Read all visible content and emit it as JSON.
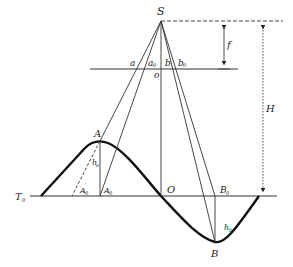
{
  "diagram": {
    "colors": {
      "line": "#333333",
      "curve": "#111111",
      "background": "#ffffff"
    },
    "labels": {
      "S": "S",
      "f": "f",
      "H": "H",
      "a": "a",
      "a0": "a",
      "a0_sub": "0",
      "b": "b",
      "b0": "b",
      "b0_sub": "0",
      "o": "o",
      "A": "A",
      "ha": "h",
      "ha_sub": "a",
      "A0p": "A",
      "A0p_sub": "0",
      "A0p_sup": "′",
      "A0": "A",
      "A0_sub": "0",
      "O": "O",
      "B0": "B",
      "B0_sub": "0",
      "hb": "h",
      "hb_sub": "b",
      "B": "B",
      "T0": "T",
      "T0_sub": "0"
    }
  }
}
